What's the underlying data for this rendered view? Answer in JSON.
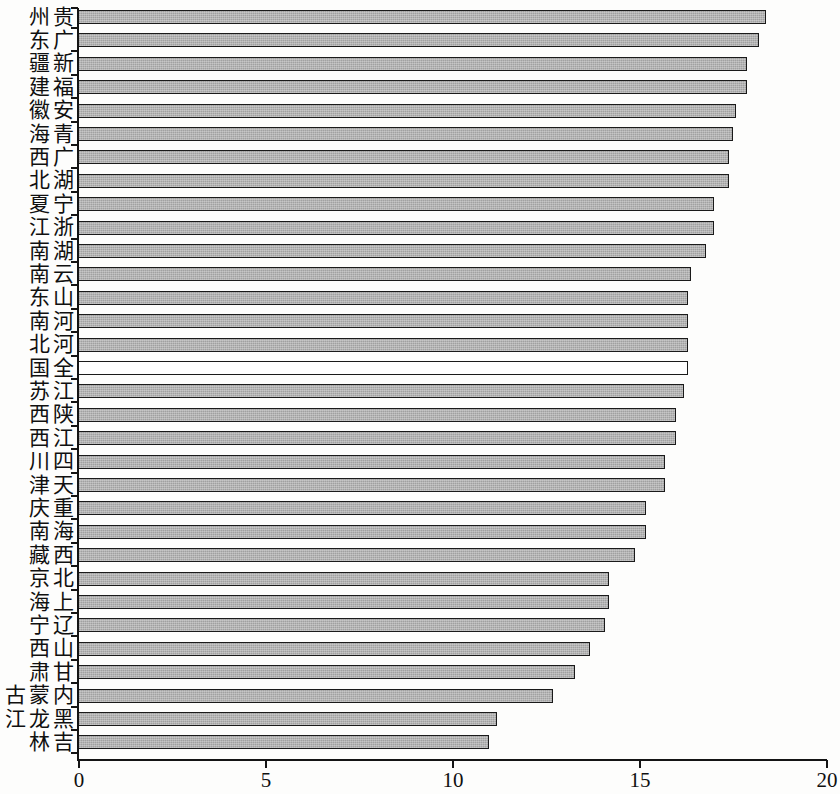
{
  "chart_data": {
    "type": "bar",
    "orientation": "horizontal",
    "title": "",
    "xlabel": "",
    "ylabel": "",
    "xlim": [
      0,
      20
    ],
    "xticks": [
      "0",
      "5",
      "10",
      "15",
      "20"
    ],
    "xtick_values": [
      0,
      5,
      10,
      15,
      20
    ],
    "grid": false,
    "legend": null,
    "series_name": "",
    "highlight_category": "全国",
    "highlight_style": "hollow-white-fill",
    "bar_fill_color": "#a9a9a9",
    "bar_edge_color": "#1a1a1a",
    "highlight_fill_color": "#ffffff",
    "axis_color": "#141414",
    "background_color": "#fdfdfc",
    "categories": [
      "贵州",
      "广东",
      "新疆",
      "福建",
      "安徽",
      "青海",
      "广西",
      "湖北",
      "宁夏",
      "浙江",
      "湖南",
      "云南",
      "山东",
      "河南",
      "河北",
      "全国",
      "江苏",
      "陕西",
      "江西",
      "四川",
      "天津",
      "重庆",
      "海南",
      "西藏",
      "北京",
      "上海",
      "辽宁",
      "山西",
      "甘肃",
      "内蒙古",
      "黑龙江",
      "吉林"
    ],
    "values": [
      18.4,
      18.2,
      17.9,
      17.9,
      17.6,
      17.5,
      17.4,
      17.4,
      17.0,
      17.0,
      16.8,
      16.4,
      16.3,
      16.3,
      16.3,
      16.3,
      16.2,
      16.0,
      16.0,
      15.7,
      15.7,
      15.2,
      15.2,
      14.9,
      14.2,
      14.2,
      14.1,
      13.7,
      13.3,
      12.7,
      11.2,
      11.0
    ]
  }
}
